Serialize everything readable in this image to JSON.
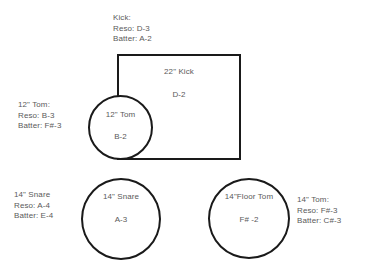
{
  "diagram": {
    "stroke_color": "#1a1a1a",
    "text_color": "#5a5a5a",
    "background_color": "#ffffff"
  },
  "pieces": {
    "kick": {
      "shape": "rectangle",
      "inner_name": "22\" Kick",
      "inner_note": "D-2",
      "annotation": {
        "heading": "Kick:",
        "reso": "Reso: D-3",
        "batter": "Batter: A-2"
      }
    },
    "rack_tom": {
      "shape": "circle",
      "inner_name": "12\" Tom",
      "inner_note": "B-2",
      "annotation": {
        "heading": "12\" Tom:",
        "reso": "Reso: B-3",
        "batter": "Batter: F#-3"
      }
    },
    "snare": {
      "shape": "circle",
      "inner_name": "14\"  Snare",
      "inner_note": "A-3",
      "annotation": {
        "heading": "14\" Snare",
        "reso": "Reso: A-4",
        "batter": "Batter: E-4"
      }
    },
    "floor_tom": {
      "shape": "circle",
      "inner_name": "14\"Floor Tom",
      "inner_note": "F# -2",
      "annotation": {
        "heading": "14\" Tom:",
        "reso": "Reso: F#-3",
        "batter": "Batter: C#-3"
      }
    }
  }
}
